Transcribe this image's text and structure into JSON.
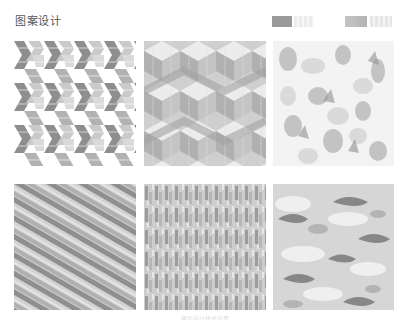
{
  "header": {
    "title": "图案设计"
  },
  "swatches": [
    {
      "name": "swatch-dark-gray",
      "color": "#9a9a9a"
    },
    {
      "name": "swatch-light-gray",
      "color": "#ececec"
    },
    {
      "name": "swatch-mid-gray",
      "color": "#bdbdbd"
    },
    {
      "name": "swatch-pale-gray",
      "color": "#e6e6e6"
    }
  ],
  "tiles": [
    {
      "id": 1,
      "style": "interlocking-chevron",
      "dark": "#8e8e8e",
      "mid": "#b5b5b5",
      "light": "#dadada"
    },
    {
      "id": 2,
      "style": "isometric-cube",
      "dark": "#a8a8a8",
      "mid": "#c6c6c6",
      "light": "#e8e8e8"
    },
    {
      "id": 3,
      "style": "faded-mottled",
      "dark": "#a0a0a0",
      "mid": "#cfcfcf",
      "light": "#f2f2f2"
    },
    {
      "id": 4,
      "style": "diagonal-stripe",
      "dark": "#8f8f8f",
      "mid": "#b0b0b0",
      "light": "#d2d2d2"
    },
    {
      "id": 5,
      "style": "vertical-noise",
      "dark": "#9c9c9c",
      "mid": "#bcbcbc",
      "light": "#dddddd"
    },
    {
      "id": 6,
      "style": "camouflage",
      "dark": "#6e6e6e",
      "mid": "#bdbdbd",
      "light": "#e6e6e6"
    }
  ],
  "caption": "图案设计样式示意"
}
